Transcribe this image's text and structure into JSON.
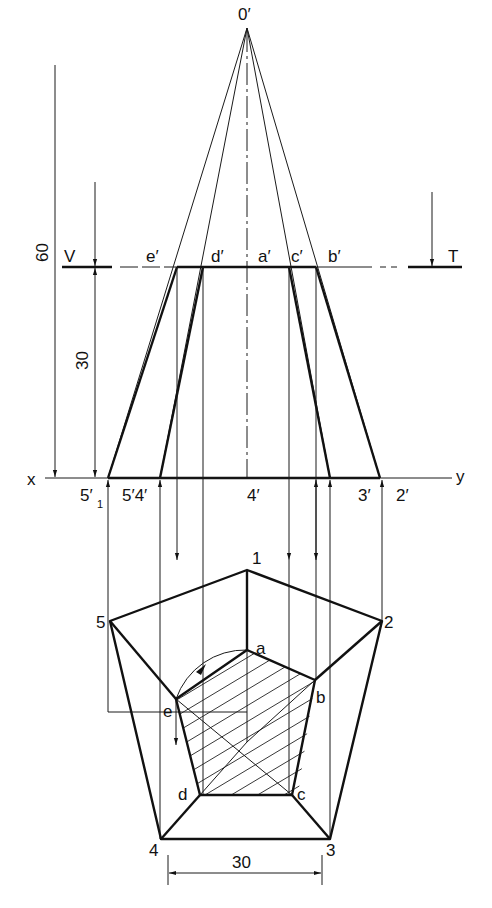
{
  "drawing": {
    "title": "Projection of a truncated regular pentagonal pyramid",
    "colors": {
      "line": "#111111",
      "background": "#ffffff"
    },
    "labels": {
      "apex": "0′",
      "cut_plane_left": "V",
      "cut_plane_right": "T",
      "front_top": {
        "e": "e′",
        "d": "d′",
        "a": "a′",
        "c": "c′",
        "b": "b′"
      },
      "axis_x": "x",
      "axis_y": "y",
      "front_base": {
        "p5_1": "5′",
        "p5_1_sub": "1",
        "p54": "5′4′",
        "p4": "4′",
        "p3": "3′",
        "p2": "2′"
      },
      "plan_outer": {
        "p1": "1",
        "p2": "2",
        "p3": "3",
        "p4": "4",
        "p5": "5"
      },
      "plan_inner": {
        "a": "a",
        "b": "b",
        "c": "c",
        "d": "d",
        "e": "e"
      }
    },
    "dimensions": {
      "total_height": "60",
      "cut_height": "30",
      "base_edge": "30"
    }
  }
}
